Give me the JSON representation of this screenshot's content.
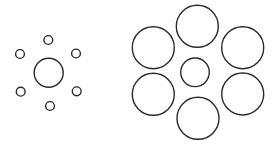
{
  "figure": {
    "type": "ebbinghaus-illusion",
    "background": "#ffffff",
    "stroke": "#2b2b2b",
    "stroke_width": 1.4
  },
  "groups": [
    {
      "name": "small-surround-group",
      "center": {
        "cx": 48.7,
        "cy": 72.7,
        "r": 14.5
      },
      "surround": [
        {
          "cx": 48.3,
          "cy": 40.0,
          "r": 4.4
        },
        {
          "cx": 20.0,
          "cy": 54.0,
          "r": 4.4
        },
        {
          "cx": 76.0,
          "cy": 53.5,
          "r": 4.4
        },
        {
          "cx": 20.7,
          "cy": 91.7,
          "r": 4.4
        },
        {
          "cx": 76.7,
          "cy": 91.3,
          "r": 4.4
        },
        {
          "cx": 50.0,
          "cy": 106.0,
          "r": 4.4
        }
      ]
    },
    {
      "name": "large-surround-group",
      "center": {
        "cx": 195.0,
        "cy": 72.3,
        "r": 14.3
      },
      "surround": [
        {
          "cx": 197.3,
          "cy": 26.3,
          "r": 21.0
        },
        {
          "cx": 153.3,
          "cy": 47.7,
          "r": 21.0
        },
        {
          "cx": 242.7,
          "cy": 47.7,
          "r": 21.0
        },
        {
          "cx": 153.3,
          "cy": 94.3,
          "r": 21.0
        },
        {
          "cx": 242.7,
          "cy": 94.0,
          "r": 21.0
        },
        {
          "cx": 198.0,
          "cy": 118.3,
          "r": 21.0
        }
      ]
    }
  ]
}
